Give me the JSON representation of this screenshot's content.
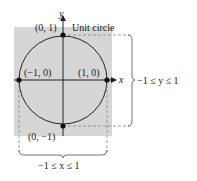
{
  "figure": {
    "caption_label": "Unit circle",
    "axes": {
      "x_label": "x",
      "y_label": "y"
    },
    "points": [
      {
        "label": "(0, 1)"
      },
      {
        "label": "(−1, 0)"
      },
      {
        "label": "(1, 0)"
      },
      {
        "label": "(0, −1)"
      }
    ],
    "y_range_label": "−1 ≤ y ≤ 1",
    "x_range_label": "−1 ≤ x ≤ 1",
    "colors": {
      "shade": "#d6d6d6",
      "line": "#222222",
      "dash": "#888888"
    }
  }
}
